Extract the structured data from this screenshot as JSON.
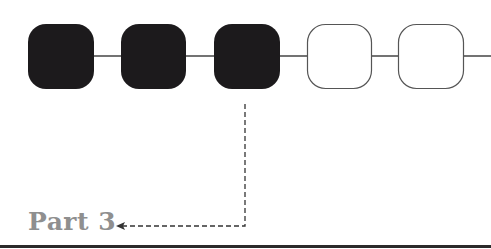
{
  "diagram": {
    "type": "progress-stepper",
    "steps": [
      {
        "index": 1,
        "state": "completed"
      },
      {
        "index": 2,
        "state": "completed"
      },
      {
        "index": 3,
        "state": "completed"
      },
      {
        "index": 4,
        "state": "pending"
      },
      {
        "index": 5,
        "state": "pending"
      }
    ],
    "current_step": 3,
    "callout_label": "Part 3",
    "colors": {
      "completed_fill": "#1c1a1c",
      "pending_fill": "#ffffff",
      "outline": "#555555",
      "connector": "#444444",
      "label": "#8f8f8f",
      "arrow": "#333333"
    }
  }
}
